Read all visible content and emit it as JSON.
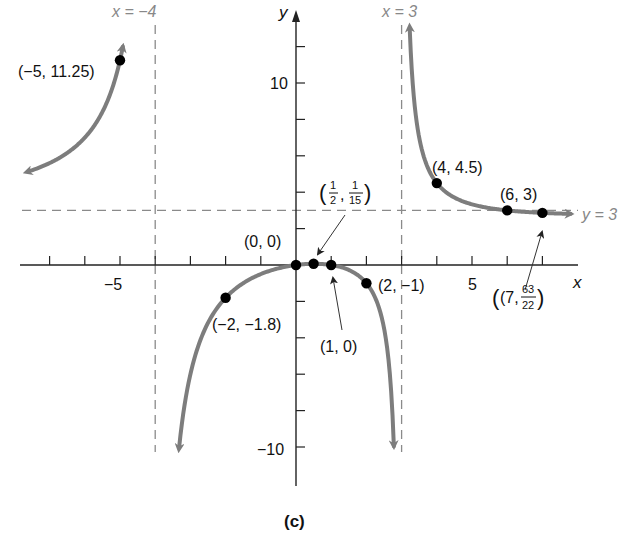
{
  "chart_data": {
    "type": "line",
    "title": "",
    "caption": "(c)",
    "function": "f(x) = 3x(x - 1) / ((x + 4)(x - 3))",
    "xlabel": "x",
    "ylabel": "y",
    "xlim": [
      -8,
      8
    ],
    "ylim": [
      -12,
      14
    ],
    "grid": false,
    "x_ticks": [
      -7,
      -6,
      -5,
      -4,
      -3,
      -2,
      -1,
      1,
      2,
      3,
      4,
      5,
      6,
      7
    ],
    "x_tick_labels": [
      {
        "value": -5,
        "label": "−5"
      },
      {
        "value": 5,
        "label": "5"
      }
    ],
    "y_ticks": [
      -10,
      -8,
      -6,
      -4,
      -2,
      2,
      4,
      6,
      8,
      10,
      12
    ],
    "y_tick_labels": [
      {
        "value": 10,
        "label": "10"
      },
      {
        "value": -10,
        "label": "−10"
      }
    ],
    "asymptotes": {
      "vertical": [
        {
          "x": -4,
          "label": "x = −4"
        },
        {
          "x": 3,
          "label": "x = 3"
        }
      ],
      "horizontal": [
        {
          "y": 3,
          "label": "y = 3"
        }
      ]
    },
    "series": [
      {
        "name": "left-branch",
        "domain": [
          -7.6,
          -4.92
        ],
        "arrow_start": true,
        "arrow_end": true
      },
      {
        "name": "middle-branch",
        "domain": [
          -3.32,
          2.78
        ],
        "arrow_start": true,
        "arrow_end": true
      },
      {
        "name": "right-branch",
        "domain": [
          3.23,
          7.8
        ],
        "arrow_start": true,
        "arrow_end": true
      }
    ],
    "points": [
      {
        "x": -5,
        "y": 11.25,
        "label": "(−5, 11.25)"
      },
      {
        "x": -2,
        "y": -1.8,
        "label": "(−2, −1.8)"
      },
      {
        "x": 0,
        "y": 0,
        "label": "(0, 0)"
      },
      {
        "x": 0.5,
        "y": 0.0667,
        "label": "(1/2, 1/15)"
      },
      {
        "x": 1,
        "y": 0,
        "label": "(1, 0)"
      },
      {
        "x": 2,
        "y": -1,
        "label": "(2, −1)"
      },
      {
        "x": 4,
        "y": 4.5,
        "label": "(4, 4.5)"
      },
      {
        "x": 6,
        "y": 3,
        "label": "(6, 3)"
      },
      {
        "x": 7,
        "y": 2.8636,
        "label": "(7, 63/22)"
      }
    ],
    "colors": {
      "curve": "#7d7d7d",
      "asymptote": "#8a8a8a",
      "axis": "#222222",
      "point": "#000000"
    }
  },
  "labels": {
    "x_axis": "x",
    "y_axis": "y",
    "asym_left": "x = −4",
    "asym_right": "x = 3",
    "asym_horiz": "y = 3",
    "tick_neg5": "−5",
    "tick_5": "5",
    "tick_10": "10",
    "tick_neg10": "−10",
    "pt_m5": "(−5, 11.25)",
    "pt_m2": "(−2, −1.8)",
    "pt_0": "(0, 0)",
    "pt_half_open": "(",
    "pt_half_num1": "1",
    "pt_half_den1": "2",
    "pt_half_comma": ",",
    "pt_half_num2": "1",
    "pt_half_den2": "15",
    "pt_half_close": ")",
    "pt_1": "(1, 0)",
    "pt_2": "(2, −1)",
    "pt_4": "(4, 4.5)",
    "pt_6": "(6, 3)",
    "pt_7_open": "(7,",
    "pt_7_num": "63",
    "pt_7_den": "22",
    "pt_7_close": ")",
    "caption": "(c)"
  }
}
